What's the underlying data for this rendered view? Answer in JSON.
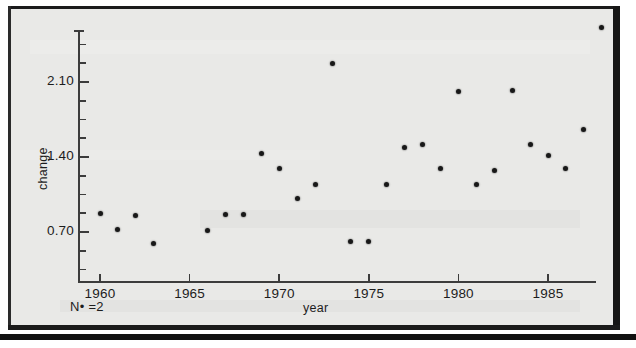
{
  "chart_data": {
    "type": "scatter",
    "title": "",
    "xlabel": "year",
    "ylabel": "change",
    "xlim": [
      1959.0,
      1988.5
    ],
    "ylim": [
      0.26,
      2.71
    ],
    "grid": false,
    "legend": null,
    "annotations": [
      {
        "text": "N• =2",
        "position": "below-left-axis"
      }
    ],
    "xticks": [
      1960,
      1965,
      1970,
      1975,
      1980,
      1985
    ],
    "xticklabels": [
      "1960",
      "1965",
      "1970",
      "1975",
      "1980",
      "1985"
    ],
    "yticks": [
      0.7,
      1.4,
      2.1
    ],
    "yticklabels": [
      "0.70",
      "1.40",
      "2.10"
    ],
    "y_minor_tick_step": 0.175,
    "marker": "filled-circle",
    "marker_color": "#181818",
    "points": [
      {
        "x": 1960,
        "y": 0.87
      },
      {
        "x": 1961,
        "y": 0.72
      },
      {
        "x": 1962,
        "y": 0.85
      },
      {
        "x": 1963,
        "y": 0.59
      },
      {
        "x": 1966,
        "y": 0.71
      },
      {
        "x": 1967,
        "y": 0.86
      },
      {
        "x": 1968,
        "y": 0.86
      },
      {
        "x": 1969,
        "y": 1.43
      },
      {
        "x": 1970,
        "y": 1.29
      },
      {
        "x": 1971,
        "y": 1.01
      },
      {
        "x": 1972,
        "y": 1.14
      },
      {
        "x": 1973,
        "y": 2.27
      },
      {
        "x": 1974,
        "y": 0.61
      },
      {
        "x": 1975,
        "y": 0.61
      },
      {
        "x": 1976,
        "y": 1.14
      },
      {
        "x": 1977,
        "y": 1.49
      },
      {
        "x": 1978,
        "y": 1.52
      },
      {
        "x": 1979,
        "y": 1.29
      },
      {
        "x": 1980,
        "y": 2.01
      },
      {
        "x": 1981,
        "y": 1.14
      },
      {
        "x": 1982,
        "y": 1.27
      },
      {
        "x": 1983,
        "y": 2.02
      },
      {
        "x": 1984,
        "y": 1.52
      },
      {
        "x": 1985,
        "y": 1.41
      },
      {
        "x": 1986,
        "y": 1.29
      },
      {
        "x": 1987,
        "y": 1.66
      },
      {
        "x": 1988,
        "y": 2.61
      }
    ]
  },
  "axis": {
    "y_title": "change",
    "x_title": "year",
    "note": "N• =2"
  },
  "colors": {
    "page_background": "#ffffff",
    "panel_background": "#e9e9e7",
    "frame": "#1b1b1b",
    "axis": "#3c3c3c",
    "text": "#1d1d1d",
    "marker": "#181818"
  }
}
